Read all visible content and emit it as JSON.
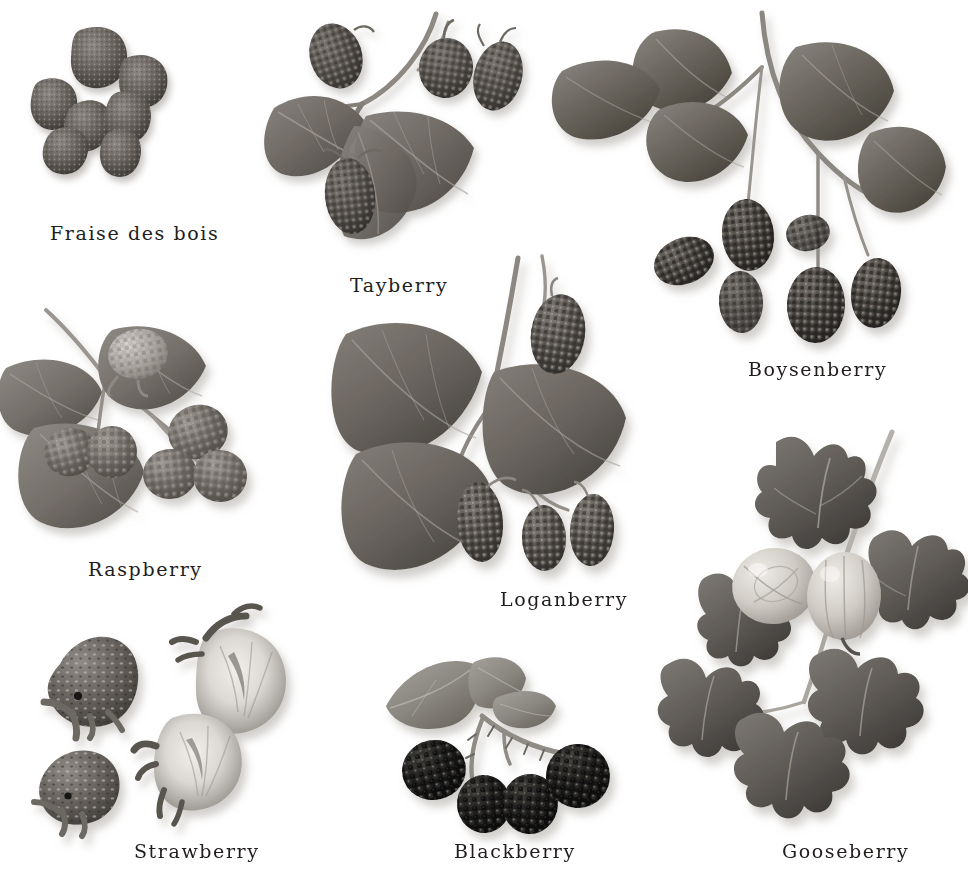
{
  "plate": {
    "title": "Berries botanical plate",
    "medium": "grayscale photographic plate",
    "background_color": "#ffffff",
    "text_color": "#201d1c",
    "width": 967,
    "height": 871
  },
  "specimens": [
    {
      "id": "fraise",
      "label": "Fraise des bois",
      "kind": "loose-fruit-cluster",
      "fruit_count": 7,
      "fruit_color": "#58534f",
      "has_foliage": false,
      "notes": "seven small wild strawberries arranged in a ring"
    },
    {
      "id": "tayberry",
      "label": "Tayberry",
      "kind": "cane-with-leaves-and-fruit",
      "fruit_count": 4,
      "leaf_count": 3,
      "fruit_color": "#5b5752",
      "leaf_color": "#6f6b66",
      "has_foliage": true,
      "notes": "elongated aggregate fruits on a thorny cane with three toothed leaves"
    },
    {
      "id": "boysenberry",
      "label": "Boysenberry",
      "kind": "branch-with-leaves-and-hanging-fruit",
      "fruit_count": 6,
      "leaf_count": 5,
      "fruit_color": "#403c39",
      "leaf_color": "#6a6661",
      "has_foliage": true,
      "notes": "long arching cane, lobed leaves upper-left, six dark fruits hanging below"
    },
    {
      "id": "raspberry",
      "label": "Raspberry",
      "kind": "spray-with-leaves-and-fruit",
      "fruit_count": 6,
      "leaf_count": 3,
      "fruit_color": "#6d6862",
      "leaf_color": "#767169",
      "has_foliage": true,
      "notes": "pale drupelet fruits, one unripe pale berry upper centre"
    },
    {
      "id": "loganberry",
      "label": "Loganberry",
      "kind": "cane-with-large-leaves-and-fruit",
      "fruit_count": 4,
      "leaf_count": 3,
      "fruit_color": "#514d49",
      "leaf_color": "#6b6761",
      "has_foliage": true,
      "notes": "three large ovate toothed leaves, long conical fruits"
    },
    {
      "id": "strawberry",
      "label": "Strawberry",
      "kind": "whole-and-halved-fruit",
      "fruit_count": 4,
      "whole_count": 2,
      "halved_count": 2,
      "fruit_color": "#5f5a56",
      "cut_flesh_color": "#d8d4cf",
      "has_foliage": false,
      "notes": "two whole berries with calyx at left, two cut halves at right showing pale core"
    },
    {
      "id": "blackberry",
      "label": "Blackberry",
      "kind": "sprig-with-leaf-and-fruit",
      "fruit_count": 4,
      "leaf_count": 1,
      "fruit_color": "#141312",
      "leaf_color": "#8a8781",
      "has_foliage": true,
      "notes": "four very dark glossy berries on a thorny stem below one compound leaf"
    },
    {
      "id": "gooseberry",
      "label": "Gooseberry",
      "kind": "branch-with-lobed-leaves-and-two-berries",
      "fruit_count": 2,
      "leaf_count": 6,
      "fruit_color": "#cfcbc4",
      "leaf_color": "#5e5a56",
      "has_foliage": true,
      "notes": "maple-like lobed leaves, two large pale translucent veined berries"
    }
  ]
}
